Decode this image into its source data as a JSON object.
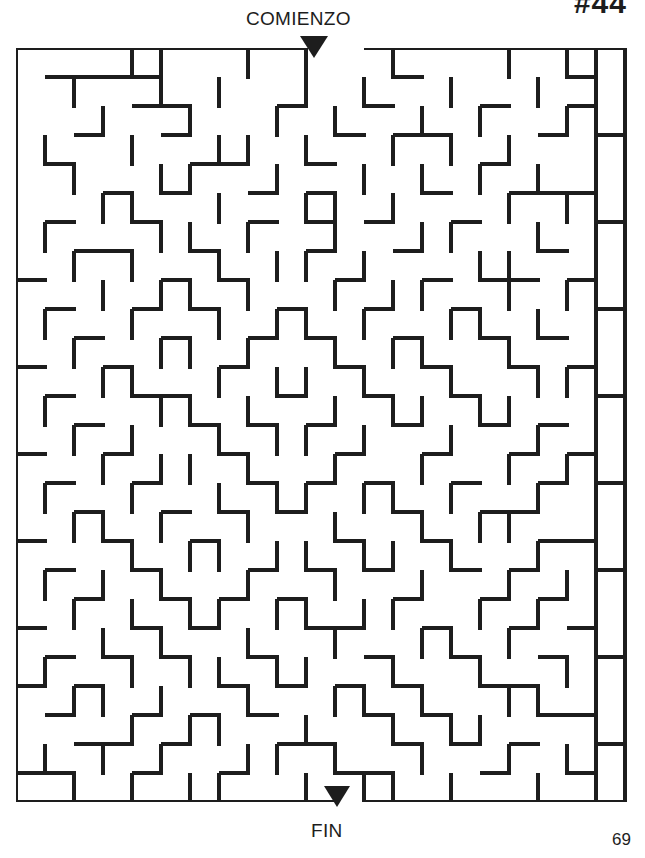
{
  "page": {
    "puzzle_number": "#44",
    "page_number": "69",
    "start_label": "COMIENZO",
    "end_label": "FIN",
    "wall_color": "#1d1d1d",
    "background_color": "#ffffff"
  },
  "maze": {
    "type": "rectangular-grid-maze",
    "cols": 21,
    "rows": 26,
    "cell_px": 29,
    "wall_thickness_px": 4,
    "origin_px": [
      16,
      48
    ],
    "entrance": {
      "side": "top",
      "col": 10,
      "label": "COMIENZO"
    },
    "exit": {
      "side": "bottom",
      "col": 11,
      "label": "FIN"
    },
    "h_walls": [
      "111111111100111111111",
      "011110000000010000010",
      "000011000100100010010",
      "001001000001011000101",
      "010000110010000010000",
      "000101001010001001110",
      "010010001010100100001",
      "001100100010010000100",
      "100001010001001011010",
      "010010100100100100001",
      "001001001010010010100",
      "100100010001001001010",
      "010011000100100100001",
      "001000101010010010100",
      "100100010001001001010",
      "010010001010100100101",
      "001001010100010011000",
      "100100100001001000110",
      "010010001010100101001",
      "001001010100010010100",
      "100010100011001001010",
      "010101001000100100101",
      "101000010101010011000",
      "010010101000101000110",
      "001101000110010101001",
      "110010010001100010010",
      "111111111110111111111"
    ],
    "v_walls": [
      "100011001010010001011",
      "101001010010100100101",
      "100100100101001010011",
      "110010011010010101001",
      "101001100100101010101",
      "100110010011010001011",
      "110001101001001100101",
      "101010010110100011001",
      "100101101001011001011",
      "110010010110100110101",
      "101001101001011001001",
      "100110010110100100111",
      "110001101001011011001",
      "101010010110100100101",
      "100101101001001001011",
      "110010010110110100101",
      "101101001001001011001",
      "100010110110110100101",
      "110101001001001001011",
      "101010110110110010101",
      "100101001001001101001",
      "110010110110010010011",
      "101101001001101001101",
      "100010110010010110001",
      "110101001101001001011",
      "101010110010110100101"
    ]
  }
}
